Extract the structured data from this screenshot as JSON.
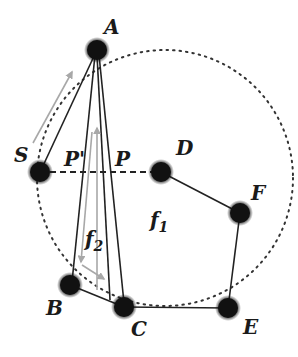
{
  "diagram": {
    "colors": {
      "node": "#111111",
      "edge": "#222222",
      "arrow": "#a8a8a8",
      "circle": "#333333",
      "background": "#ffffff"
    },
    "nodes": [
      {
        "id": "A",
        "label": "A",
        "x": 97,
        "y": 50
      },
      {
        "id": "S",
        "label": "S",
        "x": 40,
        "y": 172
      },
      {
        "id": "D",
        "label": "D",
        "x": 161,
        "y": 172
      },
      {
        "id": "F",
        "label": "F",
        "x": 240,
        "y": 213
      },
      {
        "id": "E",
        "label": "E",
        "x": 228,
        "y": 308
      },
      {
        "id": "C",
        "label": "C",
        "x": 124,
        "y": 307
      },
      {
        "id": "B",
        "label": "B",
        "x": 70,
        "y": 285
      }
    ],
    "edges": [
      {
        "from": "A",
        "to": "S",
        "style": "solid"
      },
      {
        "from": "A",
        "to": "B",
        "style": "solid"
      },
      {
        "from": "A",
        "to": "C",
        "style": "solid"
      },
      {
        "from": "B",
        "to": "C",
        "style": "solid"
      },
      {
        "from": "C",
        "to": "E",
        "style": "solid"
      },
      {
        "from": "E",
        "to": "F",
        "style": "solid"
      },
      {
        "from": "F",
        "to": "D",
        "style": "solid"
      },
      {
        "from": "S",
        "to": "D",
        "style": "dashed"
      }
    ],
    "point_labels": {
      "p_prime": "P'",
      "p": "P"
    },
    "face_labels": {
      "f1_base": "f",
      "f1_sub": "1",
      "f2_base": "f",
      "f2_sub": "2"
    },
    "circle": {
      "cx": 165,
      "cy": 178,
      "r": 128,
      "style": "dotted"
    }
  }
}
